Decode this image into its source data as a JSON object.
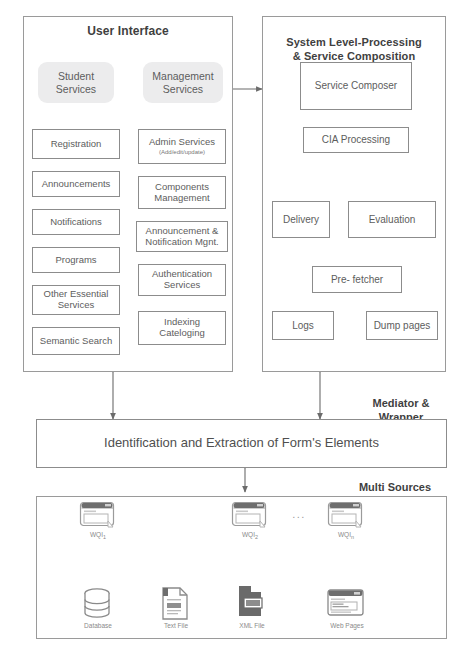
{
  "panels": {
    "user_interface": {
      "title": "User Interface"
    },
    "system_level": {
      "title": "System Level-Processing\n& Service Composition"
    },
    "mediator": {
      "label": "Mediator &\nWrapper"
    },
    "multi_sources": {
      "label": "Multi Sources"
    }
  },
  "ui_services": [
    {
      "label": "Student\nServices"
    },
    {
      "label": "Management\nServices"
    }
  ],
  "student_column": [
    {
      "label": "Registration"
    },
    {
      "label": "Announcements"
    },
    {
      "label": "Notifications"
    },
    {
      "label": "Programs"
    },
    {
      "label": "Other Essential\nServices"
    },
    {
      "label": "Semantic Search"
    }
  ],
  "management_column": [
    {
      "label": "Admin Services",
      "sub": "(Add/edit/update)"
    },
    {
      "label": "Components\nManagement"
    },
    {
      "label": "Announcement &\nNotification Mgnt."
    },
    {
      "label": "Authentication\nServices"
    },
    {
      "label": "Indexing\nCateloging"
    }
  ],
  "system_boxes": {
    "composer": "Service Composer",
    "cia": "CIA Processing",
    "delivery": "Delivery",
    "evaluation": "Evaluation",
    "prefetcher": "Pre- fetcher",
    "logs": "Logs",
    "dump": "Dump pages"
  },
  "mediator_box": {
    "label": "Identification and Extraction of Form's Elements"
  },
  "wqi_items": [
    {
      "base": "WQI",
      "sub": "1",
      "icon": "window-icon"
    },
    {
      "base": "WQI",
      "sub": "2",
      "icon": "window-icon"
    },
    {
      "base": "WQI",
      "sub": "n",
      "icon": "window-icon"
    }
  ],
  "ellipsis": "...",
  "sources": [
    {
      "label": "Database",
      "icon": "database-icon"
    },
    {
      "label": "Text File",
      "icon": "text-file-icon"
    },
    {
      "label": "XML File",
      "icon": "xml-file-icon"
    },
    {
      "label": "Web Pages",
      "icon": "web-page-icon"
    }
  ],
  "colors": {
    "border": "#8c8c8c",
    "panel_border": "#9a9a9a",
    "text": "#5d5d5d",
    "title": "#3f3f3f",
    "service_fill": "#ececed",
    "icon_dark": "#5f5f5f"
  }
}
